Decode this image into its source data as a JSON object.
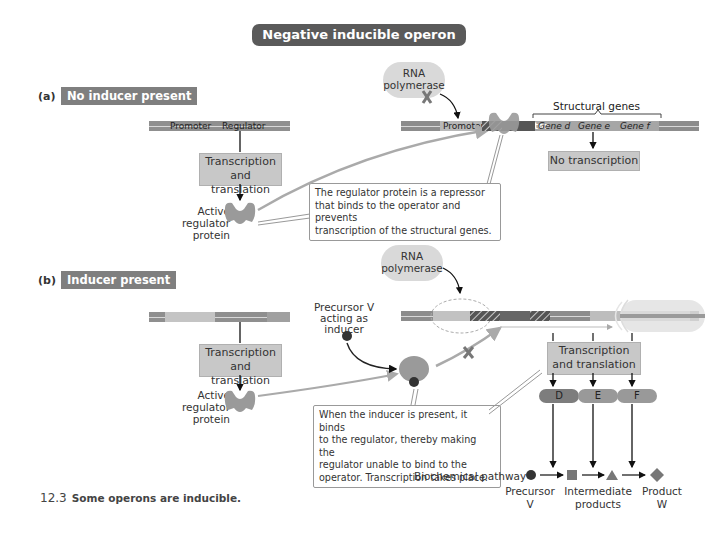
{
  "title": "Negative inducible operon",
  "section_a": {
    "letter": "(a)",
    "tag": "No inducer present",
    "regulator_gene": {
      "promoter_label": "Promoter",
      "regulator_label": "Regulator"
    },
    "transcription_box": [
      "Transcription",
      "and translation"
    ],
    "protein_label": [
      "Active",
      "regulator",
      "protein"
    ],
    "rna_polymerase": [
      "RNA",
      "polymerase"
    ],
    "structural_genes_label": "Structural genes",
    "operon_labels": {
      "promoter": "Promoter",
      "operator": "Operator",
      "gene_d": "Gene d",
      "gene_e": "Gene e",
      "gene_f": "Gene f"
    },
    "no_transcription": "No transcription",
    "callout": [
      "The regulator protein is a repressor",
      "that binds to the operator and prevents",
      "transcription of the structural genes."
    ]
  },
  "section_b": {
    "letter": "(b)",
    "tag": "Inducer present",
    "transcription_box": [
      "Transcription",
      "and translation"
    ],
    "protein_label": [
      "Active",
      "regulator",
      "protein"
    ],
    "inducer_label": [
      "Precursor V",
      "acting as",
      "inducer"
    ],
    "rna_polymerase": [
      "RNA",
      "polymerase"
    ],
    "operator_label": "Operator",
    "transcription_box_right": [
      "Transcription",
      "and translation"
    ],
    "enzymes": [
      "D",
      "E",
      "F"
    ],
    "callout": [
      "When the inducer is present, it binds",
      "to the regulator, thereby making the",
      "regulator unable to bind to the",
      "operator. Transcription takes place."
    ],
    "pathway": {
      "label": "Biochemical pathway",
      "precursor": [
        "Precursor",
        "V"
      ],
      "intermediates": [
        "Intermediate",
        "products"
      ],
      "product": [
        "Product",
        "W"
      ]
    }
  },
  "caption": {
    "number": "12.3",
    "text": "Some operons are inducible."
  },
  "colors": {
    "dark": "#5a5a5a",
    "mid": "#8f8f8f",
    "box": "#c8c8c8",
    "protein": "#9a9a9a"
  }
}
